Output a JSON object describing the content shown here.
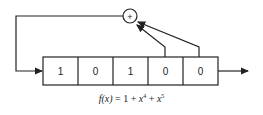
{
  "diagram": {
    "type": "linear-feedback-shift-register",
    "register": {
      "cells": [
        "1",
        "0",
        "1",
        "0",
        "0"
      ]
    },
    "xor_symbol": "+",
    "taps": [
      4,
      5
    ],
    "formula": {
      "lhs": "f(x)",
      "equals": "=",
      "terms": [
        "1",
        "x",
        "4",
        "x",
        "5"
      ],
      "plus": "+"
    },
    "colors": {
      "line": "#222222",
      "background": "#ffffff"
    }
  }
}
